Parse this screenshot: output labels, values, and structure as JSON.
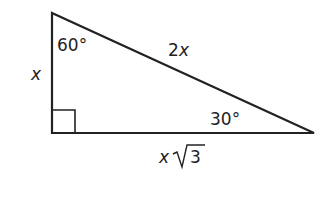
{
  "diagram": {
    "type": "30-60-90 right triangle",
    "stroke_color": "#222222",
    "vertices": {
      "top": [
        52,
        13
      ],
      "bottom_left": [
        52,
        133
      ],
      "bottom_right": [
        314,
        133
      ]
    },
    "labels": {
      "angle_top": "60°",
      "angle_right": "30°",
      "side_left": "x",
      "hypotenuse_coef": "2",
      "hypotenuse_var": "x",
      "base_var": "x",
      "base_radicand": "3"
    },
    "right_angle_marker": true
  }
}
